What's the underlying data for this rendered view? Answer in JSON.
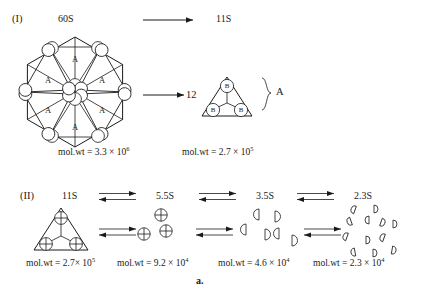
{
  "figure": {
    "caption": "a.",
    "rows": [
      {
        "id": "row-I",
        "label": "(I)",
        "species": [
          {
            "name": "60S",
            "molwt_prefix": "mol.wt = ",
            "molwt_mantissa": "3.3 × 10",
            "molwt_exponent": "6"
          },
          {
            "name": "11S",
            "molwt_prefix": "mol.wt = ",
            "molwt_mantissa": "2.7 × 10",
            "molwt_exponent": "5"
          }
        ],
        "multiplier": "12",
        "brace_label": "A",
        "hexamer_subunit_label": "A",
        "trimer_subunit_label": "B",
        "arrow_type": "single"
      },
      {
        "id": "row-II",
        "label": "(II)",
        "arrow_type": "equilibrium",
        "species": [
          {
            "name": "11S",
            "molwt_prefix": "mol.wt = ",
            "molwt_mantissa": "2.7× 10",
            "molwt_exponent": "5",
            "glyph": "triangle-trimer"
          },
          {
            "name": "5.5S",
            "molwt_prefix": "mol.wt = ",
            "molwt_mantissa": "9.2 × 10",
            "molwt_exponent": "4",
            "glyph": "three-circled-plus"
          },
          {
            "name": "3.5S",
            "molwt_prefix": "mol.wt = ",
            "molwt_mantissa": "4.6 × 10",
            "molwt_exponent": "4",
            "glyph": "six-half-discs"
          },
          {
            "name": "2.3S",
            "molwt_prefix": "mol.wt = ",
            "molwt_mantissa": "2.3 × 10",
            "molwt_exponent": "4",
            "glyph": "twelve-quarter-discs"
          }
        ]
      }
    ]
  }
}
